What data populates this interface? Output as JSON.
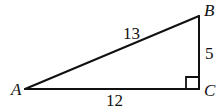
{
  "diagram": {
    "type": "right-triangle",
    "vertices": {
      "A": {
        "label": "A"
      },
      "B": {
        "label": "B"
      },
      "C": {
        "label": "C"
      }
    },
    "sides": {
      "AB": {
        "label": "13"
      },
      "BC": {
        "label": "5"
      },
      "AC": {
        "label": "12"
      }
    },
    "right_angle_at": "C"
  }
}
